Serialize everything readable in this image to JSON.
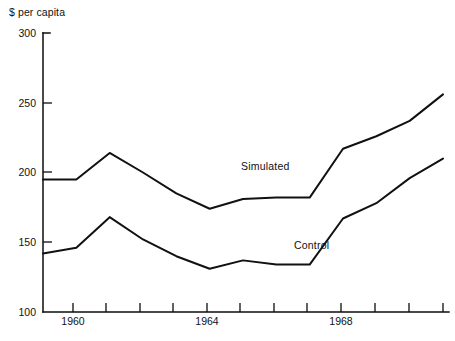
{
  "chart_data": {
    "type": "line",
    "title": "",
    "xlabel": "",
    "ylabel": "$ per capita",
    "xlim": [
      1958.8,
      1971.0
    ],
    "ylim": [
      100,
      300
    ],
    "grid": false,
    "legend_position": "inline-annotation",
    "x": [
      1959,
      1960,
      1961,
      1962,
      1963,
      1964,
      1965,
      1966,
      1967,
      1968,
      1969,
      1970,
      1971
    ],
    "y_ticks": [
      100,
      150,
      200,
      250,
      300
    ],
    "y_tick_labels": [
      "100",
      "150",
      "200",
      "250",
      "300"
    ],
    "x_ticks": [
      1959,
      1960,
      1961,
      1962,
      1963,
      1964,
      1965,
      1966,
      1967,
      1968,
      1969,
      1970,
      1971
    ],
    "x_tick_labels": [
      "",
      "1960",
      "",
      "",
      "",
      "1964",
      "",
      "",
      "",
      "1968",
      "",
      "",
      ""
    ],
    "series": [
      {
        "name": "Simulated",
        "values": [
          195,
          195,
          214,
          200,
          185,
          174,
          181,
          182,
          182,
          217,
          226,
          237,
          256
        ]
      },
      {
        "name": "Control",
        "values": [
          142,
          146,
          168,
          152,
          140,
          131,
          137,
          134,
          134,
          167,
          178,
          196,
          210
        ]
      }
    ],
    "annotations": [
      {
        "text": "Simulated",
        "x": 1965.0,
        "y": 196
      },
      {
        "text": "Control",
        "x": 1966.6,
        "y": 141
      }
    ]
  },
  "labels": {
    "y_axis_title": "$ per capita",
    "y_100": "100",
    "y_150": "150",
    "y_200": "200",
    "y_250": "250",
    "y_300": "300",
    "x_1960": "1960",
    "x_1964": "1964",
    "x_1968": "1968",
    "series_simulated": "Simulated",
    "series_control": "Control"
  },
  "colors": {
    "line": "#111111",
    "axis": "#0d0d0d",
    "background": "#ffffff"
  }
}
